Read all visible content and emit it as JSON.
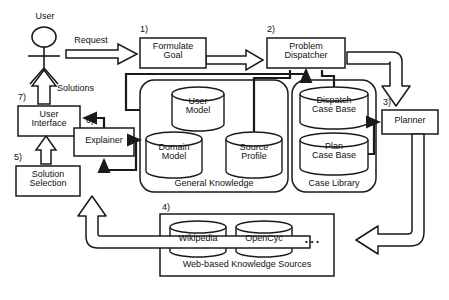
{
  "diagram": {
    "colors": {
      "stroke": "#1a1a1a",
      "fill": "#ffffff",
      "text": "#111111"
    }
  },
  "actor": {
    "name": "User",
    "icon": "stick-figure-icon"
  },
  "edge_labels": {
    "request": "Request",
    "solutions": "Solutions"
  },
  "step_numbers": {
    "formulate_goal": "1)",
    "problem_dispatcher": "2)",
    "planner": "3)",
    "web_sources": "4)",
    "solution_selection": "5)",
    "explainer": "6)",
    "user_interface": "7)"
  },
  "boxes": {
    "formulate_goal": {
      "line1": "Formulate",
      "line2": "Goal"
    },
    "problem_dispatcher": {
      "line1": "Problem",
      "line2": "Dispatcher"
    },
    "planner": {
      "line1": "Planner"
    },
    "user_interface": {
      "line1": "User",
      "line2": "Interface"
    },
    "explainer": {
      "line1": "Explainer"
    },
    "solution_selection": {
      "line1": "Solution",
      "line2": "Selection"
    }
  },
  "containers": {
    "general_knowledge": {
      "label": "General Knowledge",
      "shape": "rounded-rect",
      "stores": [
        {
          "line1": "User",
          "line2": "Model"
        },
        {
          "line1": "Domain",
          "line2": "Model"
        },
        {
          "line1": "Source",
          "line2": "Profile"
        }
      ]
    },
    "case_library": {
      "label": "Case Library",
      "shape": "rounded-rect",
      "stores": [
        {
          "line1": "Dispatch",
          "line2": "Case Base"
        },
        {
          "line1": "Plan",
          "line2": "Case Base"
        }
      ]
    },
    "web_sources": {
      "label": "Web-based Knowledge Sources",
      "shape": "rect",
      "stores": [
        {
          "line1": "Wikipedia"
        },
        {
          "line1": "OpenCyc"
        }
      ],
      "ellipsis": "..."
    }
  }
}
